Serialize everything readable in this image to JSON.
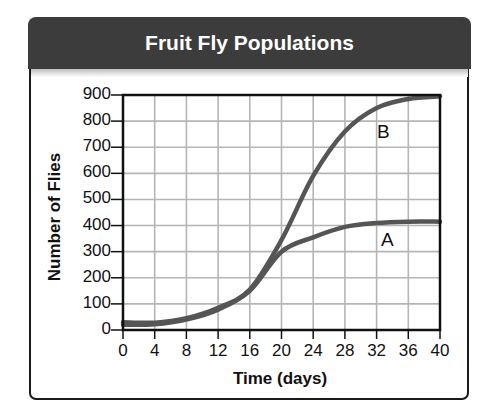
{
  "chart_data": {
    "type": "line",
    "title": "Fruit Fly Populations",
    "xlabel": "Time (days)",
    "ylabel": "Number of Flies",
    "x": [
      0,
      4,
      8,
      12,
      16,
      20,
      24,
      28,
      32,
      36,
      40
    ],
    "series": [
      {
        "name": "B",
        "values": [
          30,
          28,
          45,
          85,
          155,
          345,
          590,
          760,
          850,
          885,
          895
        ]
      },
      {
        "name": "A",
        "values": [
          20,
          22,
          40,
          78,
          150,
          300,
          355,
          395,
          410,
          415,
          415
        ]
      }
    ],
    "xlim": [
      0,
      40
    ],
    "ylim": [
      0,
      900
    ],
    "x_ticks": [
      "0",
      "4",
      "8",
      "12",
      "16",
      "20",
      "24",
      "28",
      "32",
      "36",
      "40"
    ],
    "y_ticks": [
      "0",
      "100",
      "200",
      "300",
      "400",
      "500",
      "600",
      "700",
      "800",
      "900"
    ],
    "grid": true,
    "legend": "inline labels (A, B) next to curves",
    "line_color": "#555555"
  },
  "header": {
    "title": "Fruit Fly Populations"
  },
  "axes": {
    "xlabel": "Time (days)",
    "ylabel": "Number of Flies"
  },
  "labels": {
    "A": "A",
    "B": "B"
  },
  "colors": {
    "header_bg": "#3c3c3c",
    "curve": "#555555",
    "grid": "#b5b5b5",
    "axis": "#111111"
  }
}
